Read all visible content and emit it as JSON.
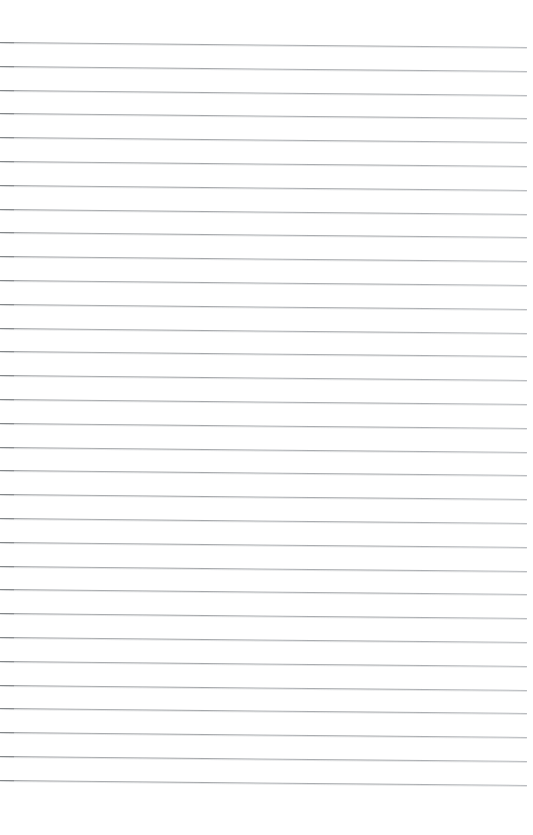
{
  "document": {
    "kind": "scanned-lined-paper",
    "title": "Lined Paper",
    "page_label": "",
    "body_text": "",
    "width_px": 533,
    "height_px": 835,
    "background_color": "#ffffff"
  },
  "ruling": {
    "line_color": "#a0a3a7",
    "line_count": 32,
    "first_line_y": 42,
    "line_spacing_px": 23.8,
    "skew_px_over_width": 5,
    "left_margin_px": 0,
    "right_margin_px": 6,
    "top_margin_px": 42,
    "bottom_margin_px": 54,
    "line_thickness_px": 1
  },
  "content": {
    "handwriting": [],
    "printed_text": [],
    "notes": ""
  }
}
